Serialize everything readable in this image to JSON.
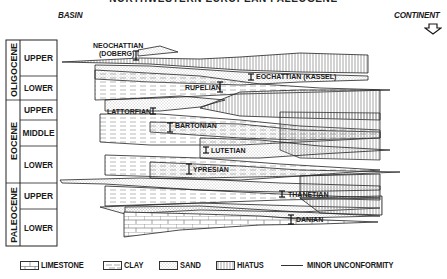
{
  "title": "NORTHWESTERN EUROPEAN PALEOGENE",
  "direction_labels": {
    "left": "BASIN",
    "right": "CONTINENT"
  },
  "icons": {
    "continent_arrow": "down-arrow-outline-icon"
  },
  "stratigraphic_column": {
    "epochs": [
      {
        "name": "OLIGOCENE",
        "subdivisions": [
          "UPPER",
          "LOWER"
        ]
      },
      {
        "name": "EOCENE",
        "subdivisions": [
          "UPPER",
          "MIDDLE",
          "LOWER"
        ]
      },
      {
        "name": "PALEOCENE",
        "subdivisions": [
          "UPPER",
          "LOWER"
        ]
      }
    ]
  },
  "stages": [
    {
      "name": "NEOCHATTIAN",
      "sub": "(DOBERG)"
    },
    {
      "name": "EOCHATTIAN (KASSEL)"
    },
    {
      "name": "RUPELIAN"
    },
    {
      "name": "LATTORFIAN"
    },
    {
      "name": "BARTONIAN"
    },
    {
      "name": "LUTETIAN"
    },
    {
      "name": "YPRESIAN"
    },
    {
      "name": "THANETIAN"
    },
    {
      "name": "DANIAN"
    }
  ],
  "legend": [
    {
      "label": "LIMESTONE",
      "pattern": "brick"
    },
    {
      "label": "CLAY",
      "pattern": "dashes"
    },
    {
      "label": "SAND",
      "pattern": "dots"
    },
    {
      "label": "HIATUS",
      "pattern": "vertical-lines"
    },
    {
      "label": "MINOR UNCONFORMITY",
      "pattern": "line"
    }
  ],
  "colors": {
    "ink": "#1a1a1a",
    "background": "#ffffff"
  }
}
